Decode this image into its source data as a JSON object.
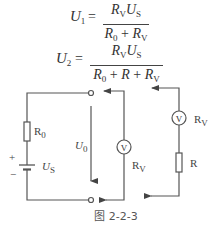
{
  "formulas": {
    "f1": {
      "lhs": "U",
      "lhs_sub": "1",
      "equals": "=",
      "numerator": [
        {
          "sym": "R",
          "sub": "V"
        },
        {
          "sym": "U",
          "sub": "S"
        }
      ],
      "denominator_text": "R0 + RV",
      "den": {
        "r0": "R",
        "r0_sub": "0",
        "plus": "+",
        "rv": "R",
        "rv_sub": "V"
      }
    },
    "f2": {
      "lhs": "U",
      "lhs_sub": "2",
      "equals": "=",
      "numerator": [
        {
          "sym": "R",
          "sub": "V"
        },
        {
          "sym": "U",
          "sub": "S"
        }
      ],
      "denominator_text": "R0 + R + RV",
      "den": {
        "r0": "R",
        "r0_sub": "0",
        "plus1": "+",
        "r": "R",
        "plus2": "+",
        "rv": "R",
        "rv_sub": "V"
      }
    }
  },
  "circuit": {
    "source": {
      "resistor_label": "R",
      "resistor_sub": "0",
      "plus": "+",
      "minus": "−",
      "voltage_label": "U",
      "voltage_sub": "S"
    },
    "open_circuit_voltage": {
      "label": "U",
      "sub": "0"
    },
    "meter_branch_1": {
      "meter_symbol": "V",
      "label": "R",
      "label_sub": "V"
    },
    "meter_branch_2": {
      "meter_symbol": "V",
      "label": "R",
      "label_sub": "V",
      "series_resistor": "R"
    }
  },
  "caption": "图 2-2-3",
  "colors": {
    "line": "#555555",
    "text": "#333333",
    "background": "#ffffff"
  }
}
